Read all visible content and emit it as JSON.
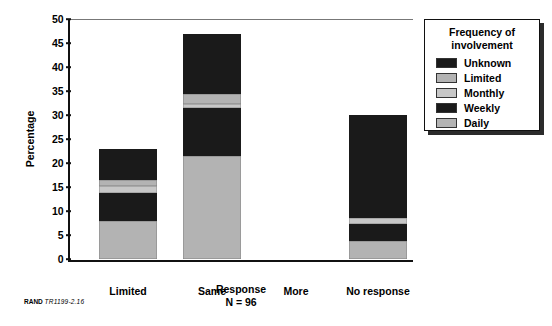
{
  "chart_data": {
    "type": "bar",
    "subtype": "stacked-bar",
    "title": "",
    "xlabel": "Response",
    "xsublabel": "N = 96",
    "ylabel": "Percentage",
    "ylim": [
      0,
      50
    ],
    "yticks": [
      0,
      5,
      10,
      15,
      20,
      25,
      30,
      35,
      40,
      45,
      50
    ],
    "grid": false,
    "legend_title_line1": "Frequency of",
    "legend_title_line2": "involvement",
    "legend_position": "right-outside",
    "categories": [
      "Limited",
      "Same",
      "More",
      "No response"
    ],
    "series": [
      {
        "name": "Daily",
        "color": "#b3b3b3",
        "values": [
          8.0,
          21.5,
          0,
          3.8
        ]
      },
      {
        "name": "Weekly",
        "color": "#1a1a1a",
        "values": [
          5.7,
          9.9,
          0,
          3.4
        ]
      },
      {
        "name": "Monthly",
        "color": "#c7c7c7",
        "values": [
          1.6,
          0.8,
          0,
          1.4
        ]
      },
      {
        "name": "Limited",
        "color": "#b3b3b3",
        "values": [
          1.2,
          2.2,
          0,
          0.0
        ]
      },
      {
        "name": "Unknown",
        "color": "#1a1a1a",
        "values": [
          6.5,
          12.5,
          0,
          21.5
        ]
      }
    ],
    "legend_order_top_to_bottom": [
      "Unknown",
      "Limited",
      "Monthly",
      "Weekly",
      "Daily"
    ],
    "totals": [
      23.0,
      46.9,
      0,
      30.1
    ]
  },
  "footer": {
    "brand": "RAND",
    "figure_id": "TR1199-2.16"
  }
}
